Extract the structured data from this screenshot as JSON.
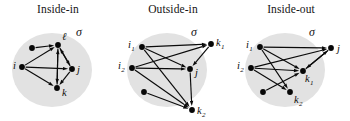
{
  "figure": {
    "caption_present": false,
    "background_color": "#ffffff",
    "region_color": "#e2e2e2",
    "node_color": "#070707",
    "edge_color": "#0a0a0a"
  },
  "panels": [
    {
      "id": "inside-in",
      "title": "Inside-in",
      "region_label": "σ",
      "nodes": [
        {
          "name": "unlabeled-1",
          "label": "",
          "x": 32,
          "y": 48,
          "inside": true
        },
        {
          "name": "l",
          "label": "ℓ",
          "sub": "",
          "x": 58,
          "y": 45,
          "inside": true,
          "label_dx": 4,
          "label_dy": -5
        },
        {
          "name": "i",
          "label": "i",
          "sub": "",
          "x": 22,
          "y": 67,
          "inside": true,
          "label_dx": -9,
          "label_dy": 2
        },
        {
          "name": "j",
          "label": "j",
          "sub": "",
          "x": 72,
          "y": 69,
          "inside": true,
          "label_dx": 5,
          "label_dy": 4
        },
        {
          "name": "k",
          "label": "k",
          "sub": "",
          "x": 57,
          "y": 88,
          "inside": true,
          "label_dx": 5,
          "label_dy": 8
        }
      ],
      "edges": [
        {
          "from": "unlabeled-1",
          "to": "l"
        },
        {
          "from": "i",
          "to": "l"
        },
        {
          "from": "i",
          "to": "j"
        },
        {
          "from": "i",
          "to": "k"
        },
        {
          "from": "l",
          "to": "j"
        },
        {
          "from": "l",
          "to": "k"
        },
        {
          "from": "j",
          "to": "l"
        },
        {
          "from": "j",
          "to": "k"
        },
        {
          "from": "k",
          "to": "l"
        }
      ]
    },
    {
      "id": "outside-in",
      "title": "Outside-in",
      "region_label": "σ",
      "nodes": [
        {
          "name": "i1",
          "label": "i",
          "sub": "1",
          "x": 27,
          "y": 47,
          "inside": true,
          "label_dx": -14,
          "label_dy": 1
        },
        {
          "name": "i2",
          "label": "i",
          "sub": "2",
          "x": 17,
          "y": 68,
          "inside": true,
          "label_dx": -14,
          "label_dy": 1
        },
        {
          "name": "j",
          "label": "j",
          "sub": "",
          "x": 75,
          "y": 69,
          "inside": true,
          "label_dx": 5,
          "label_dy": 7
        },
        {
          "name": "unlabeled-2",
          "label": "",
          "x": 29,
          "y": 92,
          "inside": true
        },
        {
          "name": "k1",
          "label": "k",
          "sub": "1",
          "x": 96,
          "y": 44,
          "inside": false,
          "label_dx": 5,
          "label_dy": 2
        },
        {
          "name": "k2",
          "label": "k",
          "sub": "2",
          "x": 77,
          "y": 110,
          "inside": false,
          "label_dx": 5,
          "label_dy": 4
        }
      ],
      "edges": [
        {
          "from": "i1",
          "to": "k1"
        },
        {
          "from": "i1",
          "to": "j"
        },
        {
          "from": "i1",
          "to": "k2"
        },
        {
          "from": "i2",
          "to": "k1"
        },
        {
          "from": "i2",
          "to": "j"
        },
        {
          "from": "i2",
          "to": "k2"
        },
        {
          "from": "unlabeled-2",
          "to": "k2"
        },
        {
          "from": "k1",
          "to": "j"
        },
        {
          "from": "j",
          "to": "k2"
        }
      ]
    },
    {
      "id": "inside-out",
      "title": "Inside-out",
      "region_label": "σ",
      "nodes": [
        {
          "name": "i1",
          "label": "i",
          "sub": "1",
          "x": 27,
          "y": 47,
          "inside": true,
          "label_dx": -14,
          "label_dy": 1
        },
        {
          "name": "i2",
          "label": "i",
          "sub": "2",
          "x": 18,
          "y": 68,
          "inside": true,
          "label_dx": -14,
          "label_dy": 1
        },
        {
          "name": "k1",
          "label": "k",
          "sub": "1",
          "x": 70,
          "y": 71,
          "inside": true,
          "label_dx": 2,
          "label_dy": 11
        },
        {
          "name": "k2",
          "label": "k",
          "sub": "2",
          "x": 57,
          "y": 92,
          "inside": true,
          "label_dx": 4,
          "label_dy": 11
        },
        {
          "name": "unlabeled-3",
          "label": "",
          "x": 30,
          "y": 92,
          "inside": true
        },
        {
          "name": "j",
          "label": "j",
          "sub": "",
          "x": 98,
          "y": 48,
          "inside": false,
          "label_dx": 6,
          "label_dy": 4
        }
      ],
      "edges": [
        {
          "from": "i1",
          "to": "j"
        },
        {
          "from": "i1",
          "to": "k1"
        },
        {
          "from": "i1",
          "to": "k2"
        },
        {
          "from": "i2",
          "to": "j"
        },
        {
          "from": "i2",
          "to": "k1"
        },
        {
          "from": "i2",
          "to": "k2"
        },
        {
          "from": "unlabeled-3",
          "to": "k1"
        },
        {
          "from": "j",
          "to": "k1"
        },
        {
          "from": "k1",
          "to": "j"
        }
      ]
    }
  ],
  "region_geometry": {
    "cx": 52,
    "cy": 70,
    "rx": 40,
    "ry": 37
  }
}
